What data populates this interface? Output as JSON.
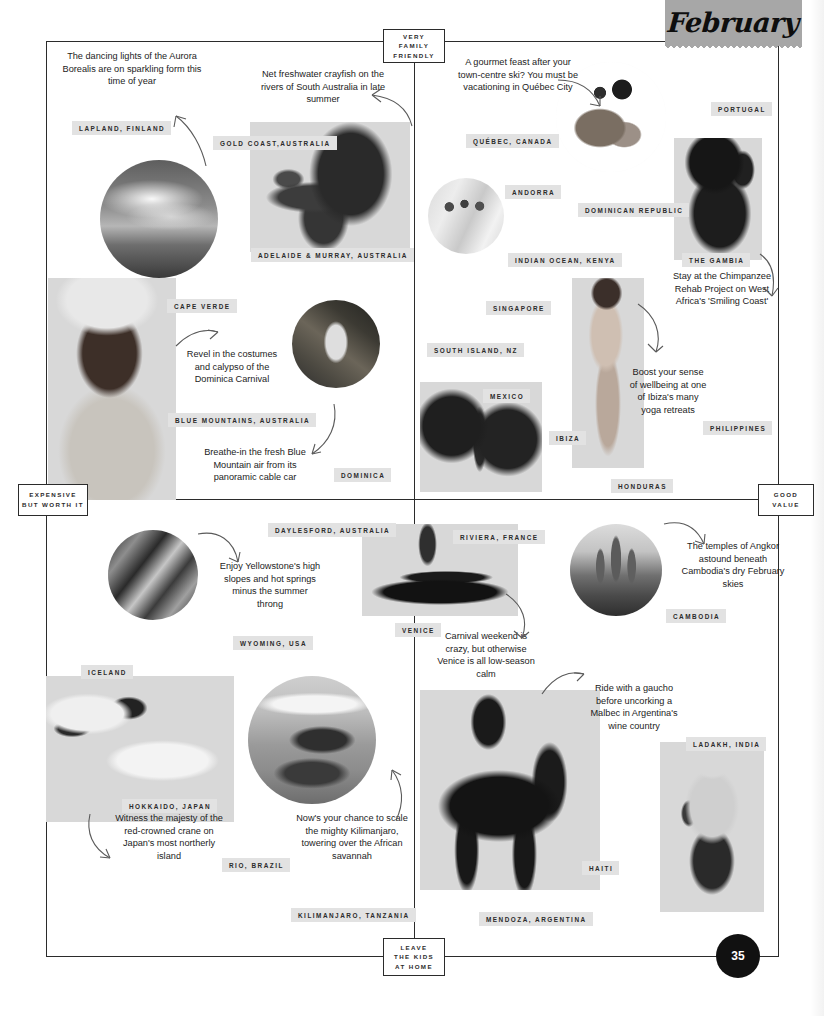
{
  "header": {
    "month": "February",
    "page_number": "35"
  },
  "axes": {
    "top": "VERY\nFAMILY\nFRIENDLY",
    "top_lines": [
      "VERY",
      "FAMILY",
      "FRIENDLY"
    ],
    "bottom_lines": [
      "LEAVE",
      "THE KIDS",
      "AT HOME"
    ],
    "left_lines": [
      "EXPENSIVE",
      "BUT WORTH IT"
    ],
    "right_lines": [
      "GOOD",
      "VALUE"
    ]
  },
  "colors": {
    "tag_background": "#e2e2e2",
    "badge_background": "#a7a7a7",
    "ink": "#2b2b2b",
    "page_number_background": "#111111"
  },
  "tags": [
    {
      "label": "LAPLAND, FINLAND"
    },
    {
      "label": "GOLD COAST,AUSTRALIA"
    },
    {
      "label": "ADELAIDE & MURRAY, AUSTRALIA"
    },
    {
      "label": "CAPE VERDE"
    },
    {
      "label": "BLUE MOUNTAINS, AUSTRALIA"
    },
    {
      "label": "DOMINICA"
    },
    {
      "label": "QUÉBEC, CANADA"
    },
    {
      "label": "PORTUGAL"
    },
    {
      "label": "ANDORRA"
    },
    {
      "label": "DOMINICAN REPUBLIC"
    },
    {
      "label": "INDIAN OCEAN, KENYA"
    },
    {
      "label": "THE GAMBIA"
    },
    {
      "label": "SINGAPORE"
    },
    {
      "label": "SOUTH ISLAND, NZ"
    },
    {
      "label": "MEXICO"
    },
    {
      "label": "IBIZA"
    },
    {
      "label": "PHILIPPINES"
    },
    {
      "label": "HONDURAS"
    },
    {
      "label": "DAYLESFORD, AUSTRALIA"
    },
    {
      "label": "WYOMING, USA"
    },
    {
      "label": "ICELAND"
    },
    {
      "label": "HOKKAIDO, JAPAN"
    },
    {
      "label": "RIO, BRAZIL"
    },
    {
      "label": "KILIMANJARO, TANZANIA"
    },
    {
      "label": "RIVIERA, FRANCE"
    },
    {
      "label": "VENICE"
    },
    {
      "label": "CAMBODIA"
    },
    {
      "label": "LADAKH, INDIA"
    },
    {
      "label": "HAITI"
    },
    {
      "label": "MENDOZA, ARGENTINA"
    }
  ],
  "blurbs": [
    {
      "text": "The dancing lights of the Aurora Borealis are on sparkling form this time of year"
    },
    {
      "text": "Net freshwater crayfish on the rivers of South Australia in late summer"
    },
    {
      "text": "A gourmet feast after your town-centre ski? You must be vacationing in Québec City"
    },
    {
      "text": "Stay at the Chimpanzee Rehab Project on West Africa's 'Smiling Coast'"
    },
    {
      "text": "Revel in the costumes and calypso of the Dominica Carnival"
    },
    {
      "text": "Breathe-in the fresh Blue Mountain air from its panoramic cable car"
    },
    {
      "text": "Boost your sense of wellbeing at one of Ibiza's many yoga retreats"
    },
    {
      "text": "Enjoy Yellowstone's high slopes and hot springs minus the summer throng"
    },
    {
      "text": "The temples of Angkor astound beneath Cambodia's dry February skies"
    },
    {
      "text": "Carnival weekend is crazy, but otherwise Venice is all low-season calm"
    },
    {
      "text": "Ride with a gaucho before uncorking a Malbec in Argentina's wine country"
    },
    {
      "text": "Witness the majesty of the red-crowned crane on Japan's most northerly island"
    },
    {
      "text": "Now's your chance to scale the mighty Kilimanjaro, towering over the African savannah"
    }
  ],
  "photos": [
    {
      "name": "aurora-borealis-photo"
    },
    {
      "name": "crayfish-photo"
    },
    {
      "name": "carnival-dancer-photo"
    },
    {
      "name": "dominica-cable-car-photo"
    },
    {
      "name": "gourmet-plate-photo"
    },
    {
      "name": "skiers-photo"
    },
    {
      "name": "chimpanzee-photo"
    },
    {
      "name": "yoga-woman-photo"
    },
    {
      "name": "butterfly-photo"
    },
    {
      "name": "canyon-photo"
    },
    {
      "name": "gondola-photo"
    },
    {
      "name": "angkor-temple-photo"
    },
    {
      "name": "crane-bird-photo"
    },
    {
      "name": "kilimanjaro-elephants-photo"
    },
    {
      "name": "horse-rider-photo"
    },
    {
      "name": "climber-photo"
    }
  ]
}
